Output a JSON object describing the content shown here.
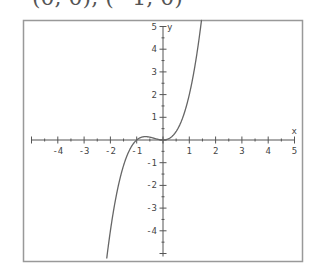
{
  "header": {
    "partial_text": "(0, 0), (−1, 0)"
  },
  "chart_data": {
    "type": "line",
    "title": "",
    "function": "y = x^3 + x^2",
    "xlabel": "x",
    "ylabel": "y",
    "xlim": [
      -5,
      5
    ],
    "ylim": [
      -5,
      5
    ],
    "grid": false,
    "x_ticks": [
      -4,
      -3,
      -2,
      -1,
      1,
      2,
      3,
      4,
      5
    ],
    "y_ticks": [
      5,
      4,
      3,
      2,
      1,
      -1,
      -2,
      -3,
      -4
    ],
    "series": [
      {
        "name": "f(x)",
        "x": [
          -2.14,
          -2.0,
          -1.75,
          -1.5,
          -1.25,
          -1.0,
          -0.8,
          -0.667,
          -0.5,
          -0.25,
          0.0,
          0.25,
          0.5,
          0.75,
          1.0,
          1.25,
          1.48
        ],
        "y": [
          -5.22,
          -4.0,
          -2.3,
          -1.13,
          -0.39,
          0.0,
          0.128,
          0.148,
          0.125,
          0.047,
          0.0,
          0.078,
          0.375,
          0.984,
          2.0,
          3.52,
          5.43
        ]
      }
    ],
    "notable_points": [
      {
        "x": -1,
        "y": 0
      },
      {
        "x": 0,
        "y": 0
      }
    ],
    "colors": {
      "curve": "#666666",
      "axes": "#555555",
      "frame": "#999999"
    }
  }
}
